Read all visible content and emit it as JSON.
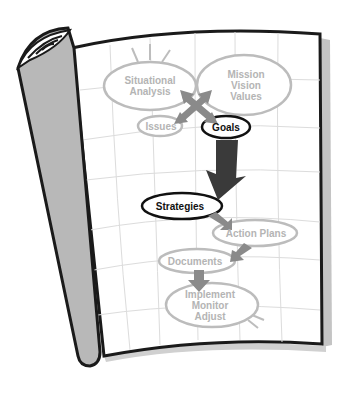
{
  "diagram": {
    "type": "planning-flow-on-curled-page",
    "colors": {
      "page": "#ffffff",
      "page_border": "#1a1a1a",
      "grid": "#dcdcdc",
      "roll_fill": "#b8b8b8",
      "faint_node": "#b4b4b4",
      "bold_node": "#111111",
      "arrow_gray": "#8a8a8a",
      "arrow_dark": "#3a3a3a"
    },
    "nodes": [
      {
        "id": "situational",
        "lines": [
          "Situational",
          "Analysis"
        ],
        "emphasis": "faint"
      },
      {
        "id": "mission",
        "lines": [
          "Mission",
          "Vision",
          "Values"
        ],
        "emphasis": "faint"
      },
      {
        "id": "issues",
        "lines": [
          "Issues"
        ],
        "emphasis": "faint"
      },
      {
        "id": "goals",
        "lines": [
          "Goals"
        ],
        "emphasis": "bold"
      },
      {
        "id": "strategies",
        "lines": [
          "Strategies"
        ],
        "emphasis": "bold"
      },
      {
        "id": "action_plans",
        "lines": [
          "Action Plans"
        ],
        "emphasis": "faint"
      },
      {
        "id": "documents",
        "lines": [
          "Documents"
        ],
        "emphasis": "faint"
      },
      {
        "id": "implement",
        "lines": [
          "Implement",
          "Monitor",
          "Adjust"
        ],
        "emphasis": "faint"
      }
    ],
    "edges": [
      {
        "from": "situational",
        "to": "goals",
        "style": "cross-arrow"
      },
      {
        "from": "mission",
        "to": "issues",
        "style": "cross-arrow"
      },
      {
        "from": "goals",
        "to": "strategies",
        "style": "large-dark-arrow"
      },
      {
        "from": "strategies",
        "to": "action_plans",
        "style": "gray-arrow"
      },
      {
        "from": "action_plans",
        "to": "documents",
        "style": "gray-arrow"
      },
      {
        "from": "documents",
        "to": "implement",
        "style": "gray-arrow"
      }
    ],
    "labels": {
      "situational_1": "Situational",
      "situational_2": "Analysis",
      "mission_1": "Mission",
      "mission_2": "Vision",
      "mission_3": "Values",
      "issues": "Issues",
      "goals": "Goals",
      "strategies": "Strategies",
      "action_plans": "Action Plans",
      "documents": "Documents",
      "implement_1": "Implement",
      "implement_2": "Monitor",
      "implement_3": "Adjust"
    }
  }
}
